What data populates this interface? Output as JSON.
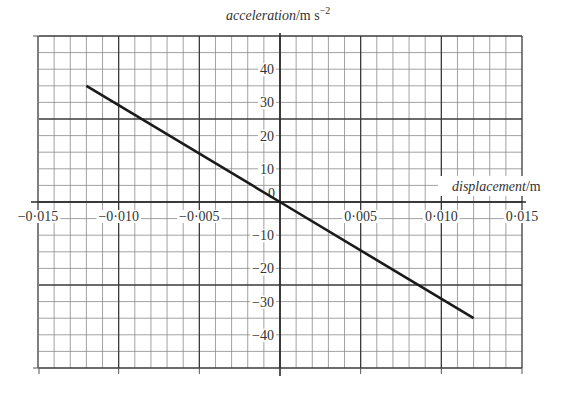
{
  "chart_data": {
    "type": "line",
    "title": "",
    "xlabel": "displacement/m",
    "xlabel_italic_part": "displacement",
    "xlabel_unit": "/m",
    "ylabel": "acceleration/m s^-2",
    "ylabel_italic_part": "acceleration",
    "ylabel_unit": "/m s",
    "ylabel_unit_exponent": "−2",
    "xlim": [
      -0.015,
      0.015
    ],
    "ylim": [
      -50,
      50
    ],
    "grid": true,
    "x_major_step": 0.005,
    "x_minor_step": 0.001,
    "y_major_step": 10,
    "y_minor_step": 5,
    "x_ticks": [
      {
        "value": -0.015,
        "label": "−0·015"
      },
      {
        "value": -0.01,
        "label": "−0·010"
      },
      {
        "value": -0.005,
        "label": "−0·005"
      },
      {
        "value": 0.005,
        "label": "0·005"
      },
      {
        "value": 0.01,
        "label": "0·010"
      },
      {
        "value": 0.015,
        "label": "0·015"
      }
    ],
    "y_ticks": [
      {
        "value": 40,
        "label": "40"
      },
      {
        "value": 30,
        "label": "30"
      },
      {
        "value": 20,
        "label": "20"
      },
      {
        "value": 10,
        "label": "10"
      },
      {
        "value": 0,
        "label": "0"
      },
      {
        "value": -10,
        "label": "−10"
      },
      {
        "value": -20,
        "label": "−20"
      },
      {
        "value": -30,
        "label": "−30"
      },
      {
        "value": -40,
        "label": "−40"
      }
    ],
    "series": [
      {
        "name": "acceleration vs displacement",
        "x": [
          -0.012,
          0.0,
          0.012
        ],
        "y": [
          35,
          0,
          -35
        ],
        "color": "#1a1a1a"
      }
    ]
  }
}
